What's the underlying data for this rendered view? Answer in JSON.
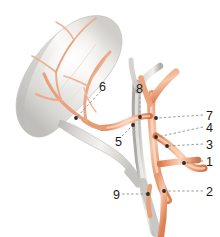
{
  "figure": {
    "background_color": "#ffffff",
    "organ_name": "gallbladder",
    "artery_color": "#e8a07a",
    "artery_color_dark": "#d4794f",
    "artery_color_light": "#f5c9ae",
    "duct_color": "#c9c9c6",
    "duct_color_dark": "#a8a8a4",
    "organ_fill": "#f2f1ef",
    "organ_shadow": "#c4c3bf",
    "leader_color": "#8c8c8c",
    "dot_color": "#2b2b2b",
    "text_color": "#1a1a1a"
  },
  "labels": [
    {
      "id": "label-1",
      "text": "1",
      "x": 206,
      "y": 156,
      "leader": {
        "x1": 203,
        "y1": 161,
        "x2": 185,
        "y2": 163,
        "dot_x": 184,
        "dot_y": 163
      }
    },
    {
      "id": "label-2",
      "text": "2",
      "x": 206,
      "y": 186,
      "leader": {
        "x1": 203,
        "y1": 191,
        "x2": 165,
        "y2": 191,
        "dot_x": 164,
        "dot_y": 191
      }
    },
    {
      "id": "label-3",
      "text": "3",
      "x": 206,
      "y": 139,
      "leader": {
        "x1": 203,
        "y1": 144,
        "x2": 168,
        "y2": 146,
        "dot_x": 167,
        "dot_y": 146
      }
    },
    {
      "id": "label-4",
      "text": "4",
      "x": 206,
      "y": 122,
      "leader": {
        "x1": 203,
        "y1": 127,
        "x2": 157,
        "y2": 137,
        "dot_x": 156,
        "dot_y": 137
      }
    },
    {
      "id": "label-5",
      "text": "5",
      "x": 115,
      "y": 136,
      "leader": {
        "x1": 122,
        "y1": 136,
        "x2": 132,
        "y2": 126,
        "dot_x": 133,
        "dot_y": 125
      }
    },
    {
      "id": "label-6",
      "text": "6",
      "x": 99,
      "y": 81,
      "leader": {
        "x1": 101,
        "y1": 91,
        "x2": 77,
        "y2": 117,
        "dot_x": 76,
        "dot_y": 118
      }
    },
    {
      "id": "label-7",
      "text": "7",
      "x": 206,
      "y": 110,
      "leader": {
        "x1": 203,
        "y1": 115,
        "x2": 157,
        "y2": 118,
        "dot_x": 156,
        "dot_y": 118
      }
    },
    {
      "id": "label-8",
      "text": "8",
      "x": 136,
      "y": 83,
      "leader": {
        "x1": 140,
        "y1": 92,
        "x2": 140,
        "y2": 116,
        "dot_x": 140,
        "dot_y": 117
      }
    },
    {
      "id": "label-9",
      "text": "9",
      "x": 113,
      "y": 189,
      "leader": {
        "x1": 122,
        "y1": 194,
        "x2": 147,
        "y2": 194,
        "dot_x": 148,
        "dot_y": 194
      }
    }
  ]
}
